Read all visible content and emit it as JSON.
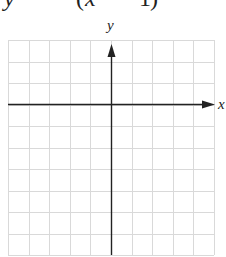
{
  "equation": {
    "text": "y = −(x + 1)",
    "parts": [
      "y",
      "(",
      "x",
      "1",
      ")"
    ]
  },
  "graph": {
    "x_axis_label": "x",
    "y_axis_label": "y",
    "grid": {
      "columns": 10,
      "rows": 10,
      "left": 8,
      "top": 40,
      "cell_width": 20.6,
      "cell_height": 21.5,
      "line_color": "#d9d9d9",
      "axis_color": "#222222"
    },
    "origin_column": 5,
    "origin_row": 3
  }
}
